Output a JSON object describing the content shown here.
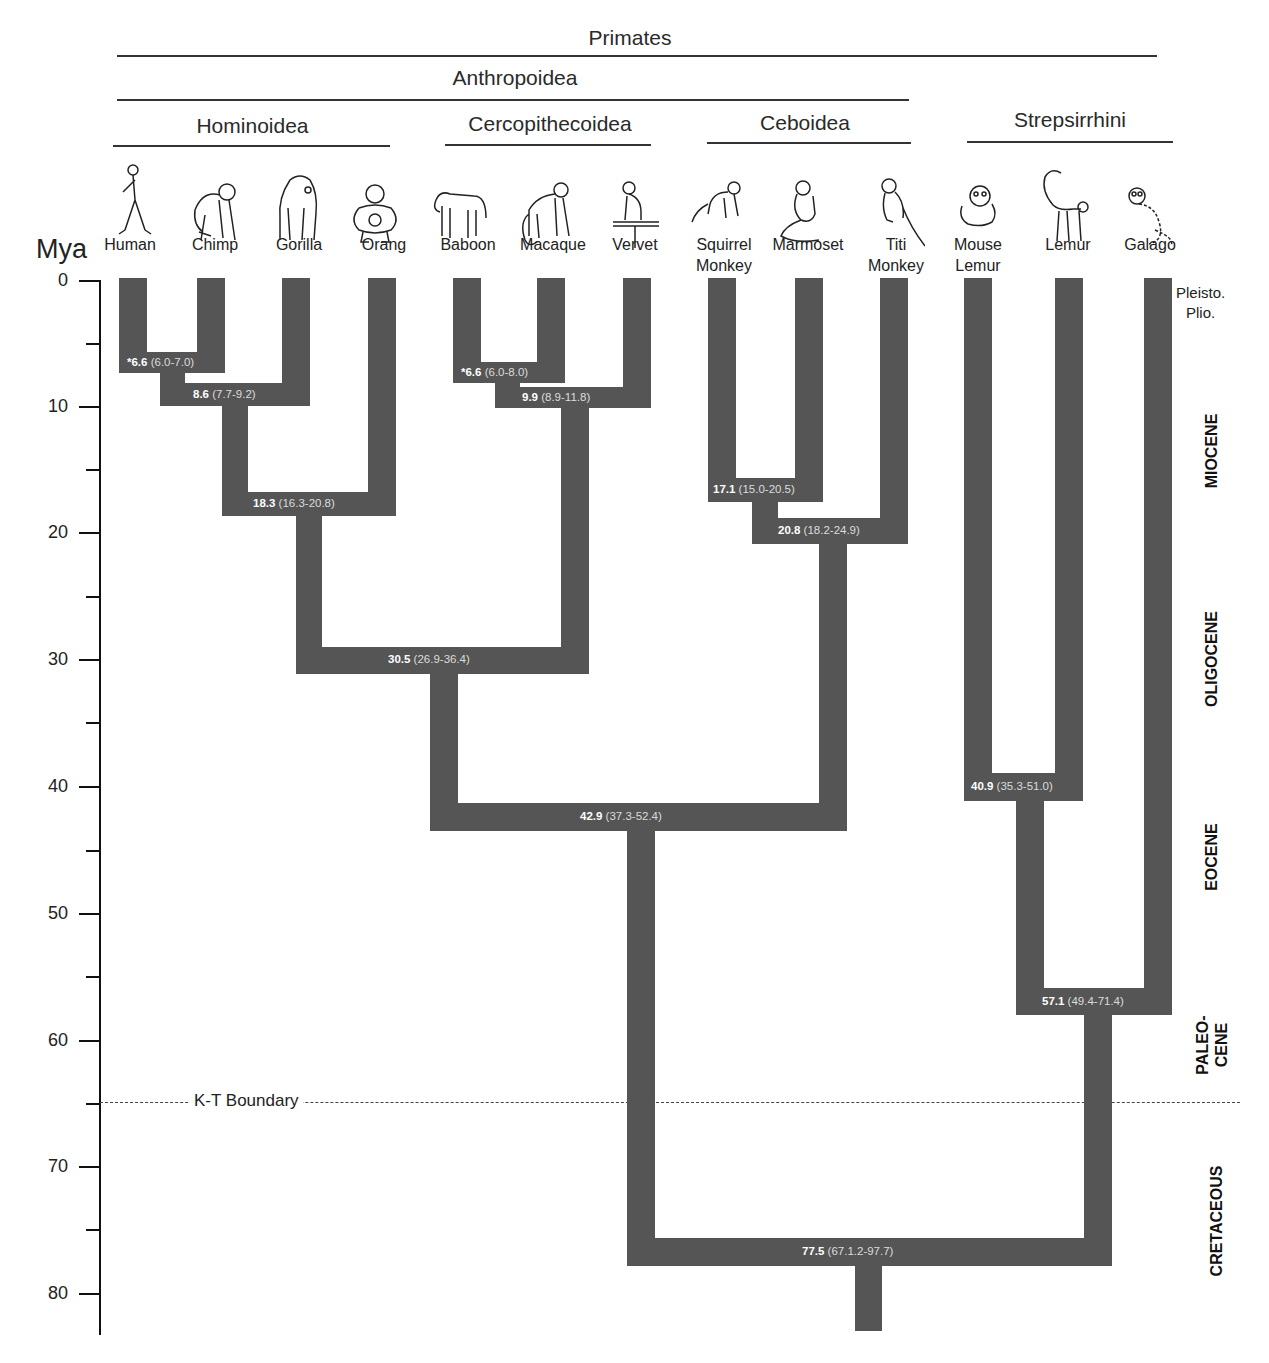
{
  "clades": {
    "primates": "Primates",
    "anthropoidea": "Anthropoidea",
    "hominoidea": "Hominoidea",
    "cercopithecoidea": "Cercopithecoidea",
    "ceboidea": "Ceboidea",
    "strepsirrhini": "Strepsirrhini"
  },
  "axis": {
    "unit": "Mya",
    "ticks": [
      "0",
      "10",
      "20",
      "30",
      "40",
      "50",
      "60",
      "70",
      "80"
    ]
  },
  "taxa": [
    {
      "name": "Human",
      "line1": "",
      "line2": "Human"
    },
    {
      "name": "Chimp",
      "line1": "",
      "line2": "Chimp"
    },
    {
      "name": "Gorilla",
      "line1": "",
      "line2": "Gorilla"
    },
    {
      "name": "Orang",
      "line1": "",
      "line2": "Orang"
    },
    {
      "name": "Baboon",
      "line1": "",
      "line2": "Baboon"
    },
    {
      "name": "Macaque",
      "line1": "",
      "line2": "Macaque"
    },
    {
      "name": "Vervet",
      "line1": "",
      "line2": "Vervet"
    },
    {
      "name": "Squirrel Monkey",
      "line1": "Squirrel",
      "line2": "Monkey"
    },
    {
      "name": "Marmoset",
      "line1": "",
      "line2": "Marmoset"
    },
    {
      "name": "Titi Monkey",
      "line1": "Titi",
      "line2": "Monkey"
    },
    {
      "name": "Mouse Lemur",
      "line1": "Mouse",
      "line2": "Lemur"
    },
    {
      "name": "Lemur",
      "line1": "",
      "line2": "Lemur"
    },
    {
      "name": "Galago",
      "line1": "",
      "line2": "Galago"
    }
  ],
  "nodes": [
    {
      "id": "human-chimp",
      "age": "*6.6",
      "ci": "(6.0-7.0)"
    },
    {
      "id": "hc-gorilla",
      "age": "8.6",
      "ci": "(7.7-9.2)"
    },
    {
      "id": "african-apes-orang",
      "age": "18.3",
      "ci": "(16.3-20.8)"
    },
    {
      "id": "baboon-macaque",
      "age": "*6.6",
      "ci": "(6.0-8.0)"
    },
    {
      "id": "papionini-vervet",
      "age": "9.9",
      "ci": "(8.9-11.8)"
    },
    {
      "id": "hominoid-cercopith",
      "age": "30.5",
      "ci": "(26.9-36.4)"
    },
    {
      "id": "squirrel-marmoset",
      "age": "17.1",
      "ci": "(15.0-20.5)"
    },
    {
      "id": "cebid-titi",
      "age": "20.8",
      "ci": "(18.2-24.9)"
    },
    {
      "id": "catarrhini-platyrrhini",
      "age": "42.9",
      "ci": "(37.3-52.4)"
    },
    {
      "id": "mouselemur-lemur",
      "age": "40.9",
      "ci": "(35.3-51.0)"
    },
    {
      "id": "lemuriformes-galago",
      "age": "57.1",
      "ci": "(49.4-71.4)"
    },
    {
      "id": "primates-root",
      "age": "77.5",
      "ci": "(67.1.2-97.7)"
    }
  ],
  "epochs": {
    "pleisto": "Pleisto.",
    "plio": "Plio.",
    "miocene": "MIOCENE",
    "oligocene": "OLIGOCENE",
    "eocene": "EOCENE",
    "paleocene_1": "PALEO-",
    "paleocene_2": "CENE",
    "cretaceous": "CRETACEOUS"
  },
  "kt_boundary": "K-T Boundary",
  "colors": {
    "branch": "#555555",
    "node_label": "#ffffff",
    "axis": "#111111"
  }
}
